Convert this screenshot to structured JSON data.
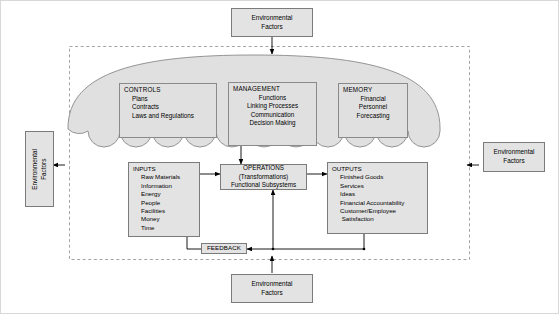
{
  "diagram": {
    "colors": {
      "box_fill": "#e3e3e3",
      "panel_fill": "#e0e0e0",
      "dome_fill": "#e0e0e0",
      "stroke": "#7b7b7b",
      "line": "#000000",
      "boundary": "#9a9a9a"
    }
  },
  "environment": {
    "top": {
      "line1": "Environmental",
      "line2": "Factors"
    },
    "left": {
      "line1": "Environmental",
      "line2": "Factors"
    },
    "right": {
      "line1": "Environmental",
      "line2": "Factors"
    },
    "bottom": {
      "line1": "Environmental",
      "line2": "Factors"
    }
  },
  "dome": {
    "panels": [
      {
        "id": "controls",
        "header": "CONTROLS",
        "items": [
          "Plans",
          "Contracts",
          "Laws and Regulations"
        ],
        "align": "left"
      },
      {
        "id": "management",
        "header": "MANAGEMENT",
        "items": [
          "Functions",
          "Linking Processes",
          "Communication",
          "Decision Making"
        ],
        "align": "center"
      },
      {
        "id": "memory",
        "header": "MEMORY",
        "items": [
          "Financial",
          "Personnel",
          "Forecasting"
        ],
        "align": "center"
      }
    ]
  },
  "flow": {
    "inputs": {
      "header": "INPUTS",
      "items": [
        "Raw Materials",
        "Information",
        "Energy",
        "People",
        "Facilities",
        "Money",
        "Time"
      ]
    },
    "operations": {
      "line1": "OPERATIONS",
      "line2": "(Transformations)",
      "line3": "Functional Subsystems"
    },
    "outputs": {
      "header": "OUTPUTS",
      "items": [
        "Finished Goods",
        "Services",
        "Ideas",
        "Financial Accountability",
        "Customer/Employee",
        " Satisfaction"
      ]
    },
    "feedback": {
      "label": "FEEDBACK"
    }
  }
}
